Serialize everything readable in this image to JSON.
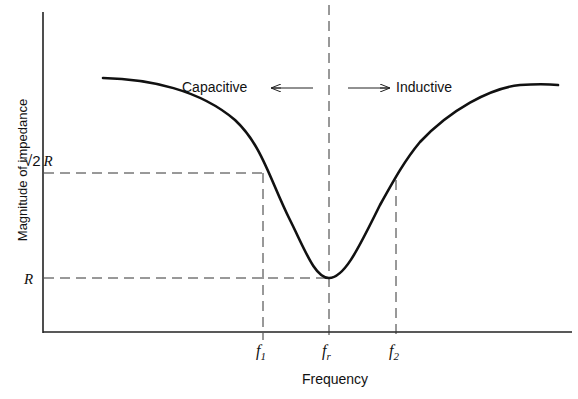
{
  "diagram": {
    "y_axis_label": "Magnitude of impedance",
    "x_axis_label": "Frequency",
    "y_ticks": {
      "sqrt2R": "√2 R",
      "R": "R"
    },
    "x_ticks": {
      "f1": {
        "base": "f",
        "sub": "1"
      },
      "fr": {
        "base": "f",
        "sub": "r"
      },
      "f2": {
        "base": "f",
        "sub": "2"
      }
    },
    "region_labels": {
      "left": "Capacitive",
      "right": "Inductive"
    },
    "colors": {
      "curve": "#111111",
      "axes": "#222222",
      "dashed": "#333333",
      "background": "#ffffff"
    }
  }
}
